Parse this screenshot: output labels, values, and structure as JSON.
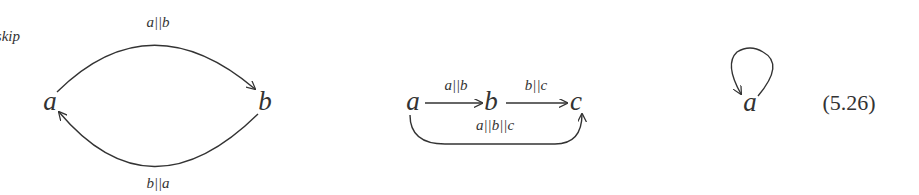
{
  "diagram_1": {
    "nodes": {
      "a": "a",
      "b": "b"
    },
    "edges": {
      "top": {
        "from": "a",
        "to": "b",
        "label": "a||b"
      },
      "bottom": {
        "from": "b",
        "to": "a",
        "label": "b||a"
      }
    }
  },
  "diagram_2": {
    "nodes": {
      "a": "a",
      "b": "b",
      "c": "c"
    },
    "edges": {
      "ab": {
        "from": "a",
        "to": "b",
        "label": "a||b"
      },
      "bc": {
        "from": "b",
        "to": "c",
        "label": "b||c"
      },
      "ac": {
        "from": "a",
        "to": "c",
        "label": "a||b||c"
      }
    }
  },
  "diagram_3": {
    "nodes": {
      "a": "a"
    },
    "edges": {
      "loop": {
        "from": "a",
        "to": "a",
        "label": "a||skip"
      }
    }
  },
  "equation_number": "(5.26)"
}
